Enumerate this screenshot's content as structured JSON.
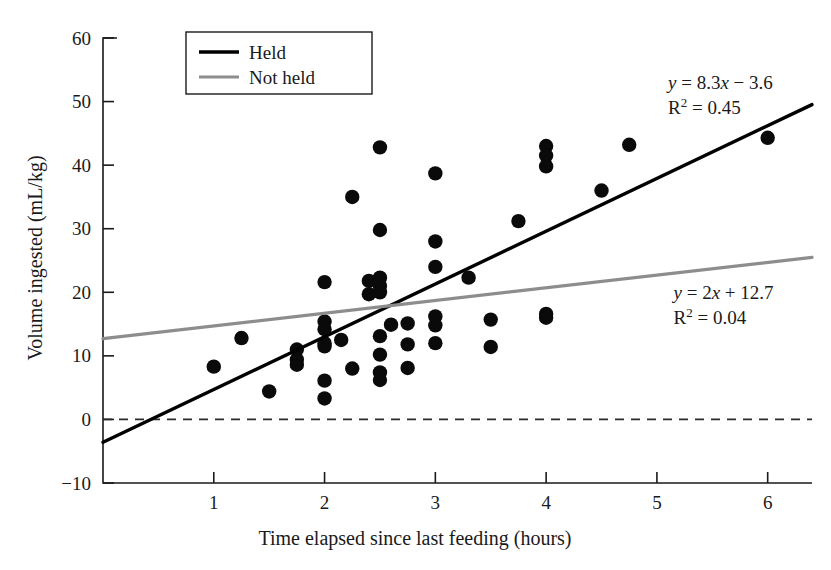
{
  "chart_data": {
    "type": "scatter",
    "title": "",
    "xlabel": "Time elapsed since last feeding (hours)",
    "ylabel": "Volume ingested (mL/kg)",
    "xlim": [
      0.0,
      6.4
    ],
    "ylim": [
      -10,
      60
    ],
    "xticks": [
      1,
      2,
      3,
      4,
      5,
      6
    ],
    "xtick_labels": [
      "1",
      "2",
      "3",
      "4",
      "5",
      "6"
    ],
    "yticks": [
      -10,
      0,
      10,
      20,
      30,
      40,
      50,
      60
    ],
    "ytick_labels": [
      "-10",
      "0",
      "10",
      "20",
      "30",
      "40",
      "50",
      "60"
    ],
    "grid": false,
    "zero_reference_line": {
      "y": 0,
      "style": "dashed",
      "color": "#2b2b2b"
    },
    "legend": {
      "position": "top-left",
      "entries": [
        {
          "name": "Held",
          "color": "#000000",
          "marker": "line"
        },
        {
          "name": "Not held",
          "color": "#8d8d8d",
          "marker": "line"
        }
      ]
    },
    "series": [
      {
        "name": "Held",
        "color": "#000000",
        "fit": {
          "equation": "y = 8.3x − 3.6",
          "equation_parts": {
            "lhs": "y",
            "eq1": " = 8.3",
            "xvar": "x",
            "rest": " − 3.6"
          },
          "slope": 8.3,
          "intercept": -3.6,
          "r_squared": 0.45,
          "r_squared_label": "R² = 0.45",
          "annotation_x": 5.1,
          "annotation_y": 52
        }
      },
      {
        "name": "Not held",
        "color": "#8d8d8d",
        "fit": {
          "equation": "y = 2x + 12.7",
          "equation_parts": {
            "lhs": "y",
            "eq1": " = 2",
            "xvar": "x",
            "rest": " + 12.7"
          },
          "slope": 2.0,
          "intercept": 12.7,
          "r_squared": 0.04,
          "r_squared_label": "R² = 0.04",
          "annotation_x": 5.15,
          "annotation_y": 19
        }
      }
    ],
    "points": [
      [
        1.0,
        8.3
      ],
      [
        1.25,
        12.8
      ],
      [
        1.5,
        4.4
      ],
      [
        1.75,
        11.0
      ],
      [
        1.75,
        9.4
      ],
      [
        1.75,
        8.6
      ],
      [
        2.0,
        21.6
      ],
      [
        2.0,
        15.4
      ],
      [
        2.0,
        14.2
      ],
      [
        2.0,
        12.0
      ],
      [
        2.0,
        11.5
      ],
      [
        2.0,
        6.1
      ],
      [
        2.0,
        3.3
      ],
      [
        2.15,
        12.5
      ],
      [
        2.25,
        35.0
      ],
      [
        2.25,
        8.0
      ],
      [
        2.4,
        21.8
      ],
      [
        2.4,
        19.7
      ],
      [
        2.5,
        42.8
      ],
      [
        2.5,
        29.8
      ],
      [
        2.5,
        22.3
      ],
      [
        2.5,
        21.0
      ],
      [
        2.5,
        20.0
      ],
      [
        2.5,
        13.1
      ],
      [
        2.5,
        10.2
      ],
      [
        2.5,
        7.4
      ],
      [
        2.5,
        6.2
      ],
      [
        2.6,
        14.9
      ],
      [
        2.75,
        15.1
      ],
      [
        2.75,
        11.8
      ],
      [
        2.75,
        8.1
      ],
      [
        3.0,
        38.7
      ],
      [
        3.0,
        28.0
      ],
      [
        3.0,
        24.0
      ],
      [
        3.0,
        16.2
      ],
      [
        3.0,
        14.8
      ],
      [
        3.0,
        12.0
      ],
      [
        3.3,
        22.3
      ],
      [
        3.5,
        15.7
      ],
      [
        3.5,
        11.4
      ],
      [
        3.75,
        31.2
      ],
      [
        4.0,
        43.0
      ],
      [
        4.0,
        41.5
      ],
      [
        4.0,
        39.8
      ],
      [
        4.0,
        16.6
      ],
      [
        4.0,
        16.0
      ],
      [
        4.5,
        36.0
      ],
      [
        4.75,
        43.2
      ],
      [
        6.0,
        44.3
      ]
    ]
  }
}
